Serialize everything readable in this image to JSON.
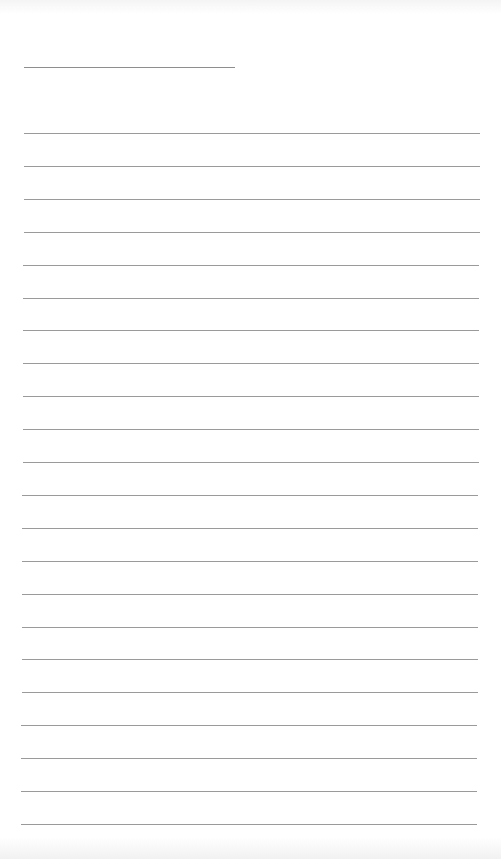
{
  "page": {
    "type": "blank lined writing page",
    "background_color": "#ffffff",
    "line_color": "#9a9a9a",
    "title_line": {
      "present": true,
      "left": 24,
      "top": 67,
      "width": 211
    },
    "ruled_lines": {
      "count": 22,
      "first_top": 133,
      "spacing": 32.9,
      "left_start": 24,
      "left_end": 21,
      "right_start": 480,
      "right_end": 477
    }
  }
}
